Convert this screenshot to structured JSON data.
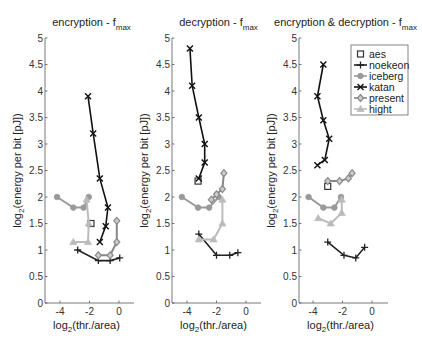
{
  "chart_data": [
    {
      "type": "line",
      "title": "encryption - f_max",
      "title_main": "encryption - f",
      "title_sub": "max",
      "xlabel": "log2(thr./area)",
      "ylabel": "log2(energy per bit [pJ])",
      "xlim": [
        -5,
        1
      ],
      "ylim": [
        0,
        5
      ],
      "xticks": [
        -4,
        -2,
        0
      ],
      "yticks": [
        0,
        0.5,
        1,
        1.5,
        2,
        2.5,
        3,
        3.5,
        4,
        4.5,
        5
      ],
      "grid": false,
      "series": [
        {
          "name": "aes",
          "x": [
            -1.9
          ],
          "y": [
            1.5
          ]
        },
        {
          "name": "noekeon",
          "x": [
            -2.8,
            -1.4,
            -0.6,
            0.05
          ],
          "y": [
            1.0,
            0.8,
            0.8,
            0.85
          ]
        },
        {
          "name": "iceberg",
          "x": [
            -4.2,
            -3.1,
            -2.4,
            -2.05
          ],
          "y": [
            2.0,
            1.8,
            1.8,
            2.0
          ]
        },
        {
          "name": "katan",
          "x": [
            -2.1,
            -1.75,
            -1.3,
            -0.75,
            -0.9,
            -1.3
          ],
          "y": [
            3.9,
            3.2,
            2.35,
            1.8,
            1.45,
            1.15
          ]
        },
        {
          "name": "present",
          "x": [
            -0.15,
            -0.15,
            -0.6,
            -1.4
          ],
          "y": [
            1.55,
            1.15,
            0.9,
            0.9
          ]
        },
        {
          "name": "hight",
          "x": [
            -2.2,
            -2.05,
            -2.1,
            -3.1
          ],
          "y": [
            1.95,
            1.5,
            1.15,
            1.15
          ]
        }
      ]
    },
    {
      "type": "line",
      "title": "decryption - f_max",
      "title_main": "decryption - f",
      "title_sub": "max",
      "xlabel": "log2(thr./area)",
      "ylabel": "log2(energy per bit [pJ])",
      "xlim": [
        -5,
        1
      ],
      "ylim": [
        0,
        5
      ],
      "xticks": [
        -4,
        -2,
        0
      ],
      "yticks": [
        0,
        0.5,
        1,
        1.5,
        2,
        2.5,
        3,
        3.5,
        4,
        4.5,
        5
      ],
      "grid": false,
      "series": [
        {
          "name": "aes",
          "x": [
            -3.25
          ],
          "y": [
            2.3
          ]
        },
        {
          "name": "noekeon",
          "x": [
            -3.2,
            -2.0,
            -1.1,
            -0.55
          ],
          "y": [
            1.3,
            0.9,
            0.9,
            0.95
          ]
        },
        {
          "name": "iceberg",
          "x": [
            -4.35,
            -3.25,
            -2.5,
            -1.85
          ],
          "y": [
            2.0,
            1.8,
            1.8,
            2.0
          ]
        },
        {
          "name": "katan",
          "x": [
            -3.8,
            -3.65,
            -3.2,
            -2.8,
            -2.8,
            -3.2
          ],
          "y": [
            4.8,
            4.1,
            3.5,
            3.0,
            2.65,
            2.35
          ]
        },
        {
          "name": "present",
          "x": [
            -2.35,
            -2.0,
            -1.6,
            -1.5
          ],
          "y": [
            1.95,
            2.05,
            2.15,
            2.45
          ]
        },
        {
          "name": "hight",
          "x": [
            -3.2,
            -2.2,
            -1.6,
            -1.6
          ],
          "y": [
            1.2,
            1.2,
            1.5,
            1.95
          ]
        }
      ]
    },
    {
      "type": "line",
      "title": "encryption & decryption - f_max",
      "title_main": "encryption & decryption - f",
      "title_sub": "max",
      "xlabel": "log2(thr./area)",
      "ylabel": "log2(energy per bit [pJ])",
      "xlim": [
        -5,
        1
      ],
      "ylim": [
        0,
        5
      ],
      "xticks": [
        -4,
        -2,
        0
      ],
      "yticks": [
        0,
        0.5,
        1,
        1.5,
        2,
        2.5,
        3,
        3.5,
        4,
        4.5,
        5
      ],
      "grid": false,
      "legend_position": "upper right",
      "series": [
        {
          "name": "aes",
          "x": [
            -3.0
          ],
          "y": [
            2.2
          ]
        },
        {
          "name": "noekeon",
          "x": [
            -3.0,
            -1.9,
            -1.1,
            -0.5
          ],
          "y": [
            1.15,
            0.9,
            0.85,
            1.05
          ]
        },
        {
          "name": "iceberg",
          "x": [
            -4.3,
            -3.3,
            -2.55,
            -2.1
          ],
          "y": [
            2.0,
            1.8,
            1.8,
            2.0
          ]
        },
        {
          "name": "katan",
          "x": [
            -3.3,
            -3.7,
            -3.3,
            -2.9,
            -3.2,
            -3.7
          ],
          "y": [
            4.5,
            3.9,
            3.45,
            3.1,
            2.7,
            2.6
          ]
        },
        {
          "name": "present",
          "x": [
            -3.0,
            -2.2,
            -1.6,
            -1.35
          ],
          "y": [
            2.3,
            2.3,
            2.35,
            2.45
          ]
        },
        {
          "name": "hight",
          "x": [
            -3.65,
            -2.8,
            -2.05,
            -2.05
          ],
          "y": [
            1.6,
            1.5,
            1.7,
            1.95
          ]
        }
      ]
    }
  ],
  "legend": {
    "entries": [
      {
        "name": "aes",
        "marker": "square",
        "color": "#333333",
        "line": false
      },
      {
        "name": "noekeon",
        "marker": "plus",
        "color": "#222222",
        "line": true
      },
      {
        "name": "iceberg",
        "marker": "circle",
        "color": "#999999",
        "line": true
      },
      {
        "name": "katan",
        "marker": "x",
        "color": "#111111",
        "line": true
      },
      {
        "name": "present",
        "marker": "diamond",
        "color": "#888888",
        "line": true
      },
      {
        "name": "hight",
        "marker": "triangle",
        "color": "#bbbbbb",
        "line": true
      }
    ]
  },
  "axis_text": {
    "xlabel_main": "log",
    "xlabel_sub": "2",
    "xlabel_rest": "(thr./area)",
    "ylabel_main": "log",
    "ylabel_sub": "2",
    "ylabel_rest": "(energy per bit [pJ])"
  }
}
